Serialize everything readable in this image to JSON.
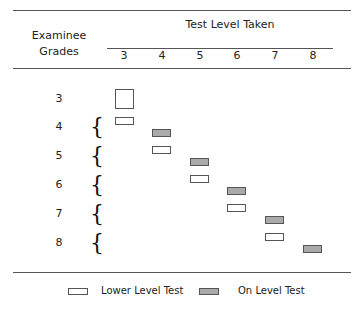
{
  "header": {
    "row_title_line1": "Examinee",
    "row_title_line2": "Grades",
    "col_group_title": "Test Level Taken",
    "columns": [
      "3",
      "4",
      "5",
      "6",
      "7",
      "8"
    ]
  },
  "rows": [
    {
      "grade": "3",
      "lower_level": null,
      "on_level": "3"
    },
    {
      "grade": "4",
      "lower_level": "3",
      "on_level": "4"
    },
    {
      "grade": "5",
      "lower_level": "4",
      "on_level": "5"
    },
    {
      "grade": "6",
      "lower_level": "5",
      "on_level": "6"
    },
    {
      "grade": "7",
      "lower_level": "6",
      "on_level": "7"
    },
    {
      "grade": "8",
      "lower_level": "7",
      "on_level": "8"
    }
  ],
  "legend": {
    "lower": "Lower Level Test",
    "on": "On Level Test"
  },
  "colors": {
    "lower_fill": "#ffffff",
    "on_fill": "#aaaaaa",
    "border": "#555555"
  }
}
